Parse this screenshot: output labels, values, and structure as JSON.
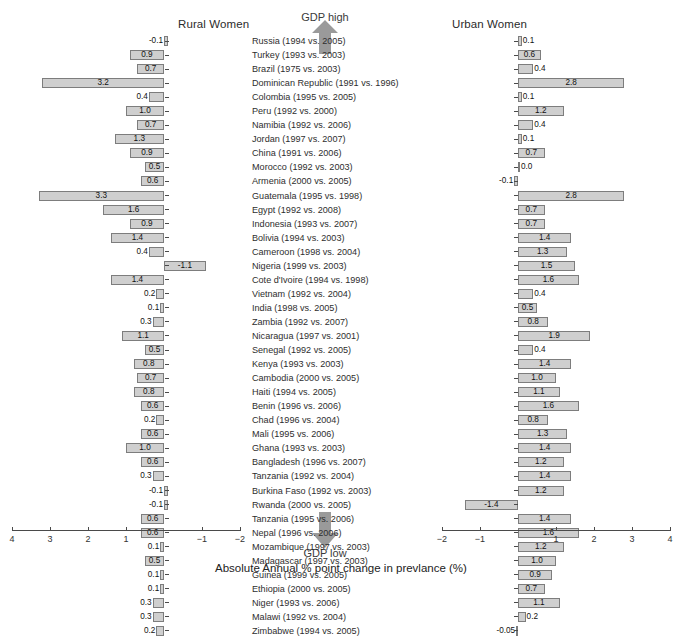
{
  "chart_data": {
    "type": "bar",
    "title": "",
    "xlabel": "Absolute Annual % point change in prevlance (%)",
    "ylabel": "",
    "panels": [
      {
        "name": "Rural Women",
        "xlim": [
          4,
          -2
        ],
        "reversed": true,
        "ticks": [
          4,
          3,
          2,
          1,
          0,
          -1,
          -2
        ],
        "tick_labels": [
          "4",
          "3",
          "2",
          "1",
          "0",
          "-1",
          "-2"
        ]
      },
      {
        "name": "Urban Women",
        "xlim": [
          -2,
          4
        ],
        "reversed": false,
        "ticks": [
          -2,
          -1,
          0,
          1,
          2,
          3,
          4
        ],
        "tick_labels": [
          "-2",
          "-1",
          "0",
          "1",
          "2",
          "3",
          "4"
        ]
      }
    ],
    "annotations": {
      "top": "GDP high",
      "bottom": "GDP low",
      "arrow_color": "#9a9a9a"
    },
    "grid": false,
    "legend": null,
    "categories": [
      "Russia (1994 vs. 2005)",
      "Turkey (1993 vs. 2003)",
      "Brazil (1975 vs. 2003)",
      "Dominican Republic (1991 vs. 1996)",
      "Colombia (1995 vs. 2005)",
      "Peru (1992 vs. 2000)",
      "Namibia (1992 vs. 2006)",
      "Jordan (1997 vs. 2007)",
      "China (1991 vs. 2006)",
      "Morocco (1992 vs. 2003)",
      "Armenia (2000 vs. 2005)",
      "Guatemala (1995 vs. 1998)",
      "Egypt (1992 vs. 2008)",
      "Indonesia (1993 vs. 2007)",
      "Bolivia (1994 vs. 2003)",
      "Cameroon (1998 vs. 2004)",
      "Nigeria (1999 vs. 2003)",
      "Cote d'Ivoire (1994 vs. 1998)",
      "Vietnam (1992 vs. 2004)",
      "India (1998 vs. 2005)",
      "Zambia (1992 vs. 2007)",
      "Nicaragua (1997 vs. 2001)",
      "Senegal (1992 vs. 2005)",
      "Kenya (1993 vs. 2003)",
      "Cambodia (2000 vs. 2005)",
      "Haiti (1994 vs. 2005)",
      "Benin (1996 vs. 2006)",
      "Chad (1996 vs. 2004)",
      "Mali (1995 vs. 2006)",
      "Ghana (1993 vs. 2003)",
      "Bangladesh (1996 vs. 2007)",
      "Tanzania (1992 vs. 2004)",
      "Burkina Faso (1992 vs. 2003)",
      "Rwanda (2000 vs. 2005)",
      "Tanzania (1995 vs. 2006)",
      "Nepal (1996 vs. 2006)",
      "Mozambique (1997 vs. 2003)",
      "Madagascar (1997 vs. 2003)",
      "Guinea (1999 vs. 2005)",
      "Ethiopia (2000 vs. 2005)",
      "Niger (1993 vs. 2006)",
      "Malawi (1992 vs. 2004)",
      "Zimbabwe (1994 vs. 2005)"
    ],
    "series": [
      {
        "name": "Rural Women",
        "values": [
          -0.1,
          0.9,
          0.7,
          3.2,
          0.4,
          1.0,
          0.7,
          1.3,
          0.9,
          0.5,
          0.6,
          3.3,
          1.6,
          0.9,
          1.4,
          0.4,
          -1.1,
          1.4,
          0.2,
          0.1,
          0.3,
          1.1,
          0.5,
          0.8,
          0.7,
          0.8,
          0.6,
          0.2,
          0.6,
          1.0,
          0.6,
          0.3,
          -0.1,
          -0.1,
          0.6,
          0.6,
          0.1,
          0.5,
          0.1,
          0.1,
          0.3,
          0.3,
          0.2
        ],
        "labels": [
          "-0.1",
          "0.9",
          "0.7",
          "3.2",
          "0.4",
          "1.0",
          "0.7",
          "1.3",
          "0.9",
          "0.5",
          "0.6",
          "3.3",
          "1.6",
          "0.9",
          "1.4",
          "0.4",
          "-1.1",
          "1.4",
          "0.2",
          "0.1",
          "0.3",
          "1.1",
          "0.5",
          "0.8",
          "0.7",
          "0.8",
          "0.6",
          "0.2",
          "0.6",
          "1.0",
          "0.6",
          "0.3",
          "-0.1",
          "-0.1",
          "0.6",
          "0.6",
          "0.1",
          "0.5",
          "0.1",
          "0.1",
          "0.3",
          "0.3",
          "0.2"
        ]
      },
      {
        "name": "Urban Women",
        "values": [
          0.1,
          0.6,
          0.4,
          2.8,
          0.1,
          1.2,
          0.4,
          0.1,
          0.7,
          0.0,
          -0.1,
          2.8,
          0.7,
          0.7,
          1.4,
          1.3,
          1.5,
          1.6,
          0.4,
          0.5,
          0.8,
          1.9,
          0.4,
          1.4,
          1.0,
          1.1,
          1.6,
          0.8,
          1.3,
          1.4,
          1.2,
          1.4,
          1.2,
          -1.4,
          1.4,
          1.6,
          1.2,
          1.0,
          0.9,
          0.7,
          1.1,
          0.2,
          -0.05
        ],
        "labels": [
          "0.1",
          "0.6",
          "0.4",
          "2.8",
          "0.1",
          "1.2",
          "0.4",
          "0.1",
          "0.7",
          "0.0",
          "-0.1",
          "2.8",
          "0.7",
          "0.7",
          "1.4",
          "1.3",
          "1.5",
          "1.6",
          "0.4",
          "0.5",
          "0.8",
          "1.9",
          "0.4",
          "1.4",
          "1.0",
          "1.1",
          "1.6",
          "0.8",
          "1.3",
          "1.4",
          "1.2",
          "1.4",
          "1.2",
          "-1.4",
          "1.4",
          "1.6",
          "1.2",
          "1.0",
          "0.9",
          "0.7",
          "1.1",
          "0.2",
          "-0.05"
        ]
      }
    ]
  }
}
